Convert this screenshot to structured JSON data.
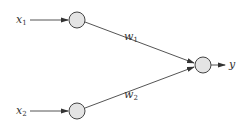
{
  "diagram": {
    "type": "neural-network-perceptron",
    "colors": {
      "line": "#555555",
      "node_fill": "#e4e4e4",
      "node_stroke": "#444444",
      "text": "#333333"
    },
    "inputs": [
      {
        "label": "x",
        "sub": "1"
      },
      {
        "label": "x",
        "sub": "2"
      }
    ],
    "weights": [
      {
        "label": "w",
        "sub": "1"
      },
      {
        "label": "w",
        "sub": "2"
      }
    ],
    "output": {
      "label": "y"
    }
  }
}
